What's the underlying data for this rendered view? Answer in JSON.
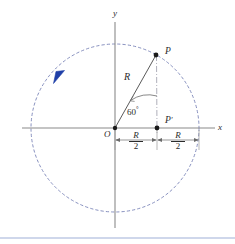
{
  "figure": {
    "background_color": "#ffffff",
    "axes": {
      "x_label": "x",
      "y_label": "y",
      "origin_label": "O",
      "axis_color": "#8a8a8a"
    },
    "circle": {
      "center": [
        115,
        128
      ],
      "radius": 84,
      "stroke_color": "#7b84b8",
      "style": "dashed"
    },
    "rotation_arrow": {
      "color": "#1f3fa8",
      "direction": "counterclockwise",
      "position": [
        58,
        77
      ]
    },
    "points": [
      {
        "name": "P",
        "label": "P",
        "x": 156,
        "y": 55,
        "label_dx": 8,
        "label_dy": -9
      },
      {
        "name": "P'",
        "label": "P",
        "prime": true,
        "x": 157,
        "y": 128,
        "label_dx": 8,
        "label_dy": -13
      }
    ],
    "radius_label": "R",
    "angle_label": "60",
    "angle_unit": "°",
    "dimensions": [
      {
        "name": "left-half-radius",
        "numerator": "R",
        "denominator": "2",
        "from_x": 115,
        "to_x": 157,
        "y": 140
      },
      {
        "name": "right-half-radius",
        "numerator": "R",
        "denominator": "2",
        "from_x": 157,
        "to_x": 199,
        "y": 140
      }
    ],
    "footer_rule": {
      "color": "#9fb0d8",
      "y": 238
    }
  }
}
